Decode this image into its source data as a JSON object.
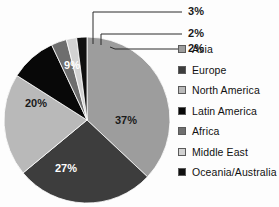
{
  "chart_data": {
    "type": "pie",
    "title": "",
    "xlabel": "",
    "ylabel": "",
    "legend_position": "right",
    "grid": false,
    "start_angle_deg": 0,
    "direction": "clockwise",
    "categories": [
      "Asia",
      "Europe",
      "North America",
      "Latin America",
      "Africa",
      "Middle East",
      "Oceania/Australia"
    ],
    "values": [
      37,
      27,
      20,
      9,
      3,
      2,
      2
    ],
    "value_labels": [
      "37%",
      "27%",
      "20%",
      "9%",
      "3%",
      "2%",
      "2%"
    ],
    "colors": [
      "#9d9d9d",
      "#3d3d3d",
      "#b9b9b9",
      "#080808",
      "#6e6e6e",
      "#d2d2d2",
      "#101010"
    ],
    "label_text_colors": [
      "#1a1a1a",
      "#ffffff",
      "#1a1a1a",
      "#ffffff",
      "#1a1a1a",
      "#1a1a1a",
      "#1a1a1a"
    ],
    "slices": [
      {
        "name": "Asia",
        "value": 37,
        "label": "37%",
        "color": "#9d9d9d",
        "label_placement": "inside"
      },
      {
        "name": "Europe",
        "value": 27,
        "label": "27%",
        "color": "#3d3d3d",
        "label_placement": "inside"
      },
      {
        "name": "North America",
        "value": 20,
        "label": "20%",
        "color": "#b9b9b9",
        "label_placement": "inside"
      },
      {
        "name": "Latin America",
        "value": 9,
        "label": "9%",
        "color": "#080808",
        "label_placement": "inside"
      },
      {
        "name": "Africa",
        "value": 3,
        "label": "3%",
        "color": "#6e6e6e",
        "label_placement": "callout"
      },
      {
        "name": "Middle East",
        "value": 2,
        "label": "2%",
        "color": "#d2d2d2",
        "label_placement": "callout"
      },
      {
        "name": "Oceania/Australia",
        "value": 2,
        "label": "2%",
        "color": "#101010",
        "label_placement": "callout"
      }
    ]
  },
  "pie": {
    "inside_labels": [
      {
        "text": "37%",
        "x": 126,
        "y": 124
      },
      {
        "text": "27%",
        "x": 66,
        "y": 172
      },
      {
        "text": "20%",
        "x": 36,
        "y": 107
      },
      {
        "text": "9%",
        "x": 72,
        "y": 69
      }
    ],
    "callouts": [
      {
        "text": "3%",
        "x": 196,
        "y": 15
      },
      {
        "text": "2%",
        "x": 196,
        "y": 37
      },
      {
        "text": "2%",
        "x": 196,
        "y": 52
      }
    ]
  },
  "legend": {
    "items": [
      {
        "label": "Asia",
        "color": "#9d9d9d"
      },
      {
        "label": "Europe",
        "color": "#3d3d3d"
      },
      {
        "label": "North America",
        "color": "#b9b9b9"
      },
      {
        "label": "Latin America",
        "color": "#080808"
      },
      {
        "label": "Africa",
        "color": "#6e6e6e"
      },
      {
        "label": "Middle East",
        "color": "#d2d2d2"
      },
      {
        "label": "Oceania/Australia",
        "color": "#101010"
      }
    ]
  }
}
